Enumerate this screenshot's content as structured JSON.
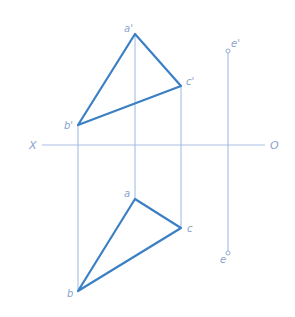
{
  "diagram": {
    "type": "orthographic-projection",
    "axis": {
      "left_label": "X",
      "right_label": "O"
    },
    "colors": {
      "edge": "#3b7fc4",
      "projector": "#9ab8e0",
      "axis": "#a9c2e6",
      "label": "#8aa3cc"
    },
    "front_view": {
      "points": [
        {
          "name": "a'",
          "label": "a'"
        },
        {
          "name": "b'",
          "label": "b'"
        },
        {
          "name": "c'",
          "label": "c'"
        },
        {
          "name": "e'",
          "label": "e'"
        }
      ]
    },
    "top_view": {
      "points": [
        {
          "name": "a",
          "label": "a"
        },
        {
          "name": "b",
          "label": "b"
        },
        {
          "name": "c",
          "label": "c"
        },
        {
          "name": "e",
          "label": "e"
        }
      ]
    }
  }
}
